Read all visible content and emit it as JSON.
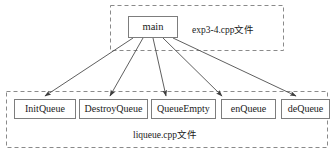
{
  "diagram": {
    "type": "call-hierarchy",
    "title": "",
    "groups": [
      {
        "id": "exp3-4",
        "label": "exp3-4.cpp文件",
        "border_style": "dashed",
        "border_color": "#8a8a8a"
      },
      {
        "id": "liqueue",
        "label": "liqueue.cpp文件",
        "border_style": "dashed",
        "border_color": "#8a8a8a"
      }
    ],
    "nodes": {
      "main": {
        "label": "main"
      },
      "functions": [
        {
          "label": "InitQueue"
        },
        {
          "label": "DestroyQueue"
        },
        {
          "label": "QueueEmpty"
        },
        {
          "label": "enQueue"
        },
        {
          "label": "deQueue"
        }
      ]
    },
    "edges": [
      {
        "from": "main",
        "to": "InitQueue",
        "arrow": "filled"
      },
      {
        "from": "main",
        "to": "DestroyQueue",
        "arrow": "filled"
      },
      {
        "from": "main",
        "to": "QueueEmpty",
        "arrow": "filled"
      },
      {
        "from": "main",
        "to": "enQueue",
        "arrow": "filled"
      },
      {
        "from": "main",
        "to": "deQueue",
        "arrow": "filled"
      }
    ],
    "colors": {
      "node_border": "#7d7d7d",
      "group_border": "#8a8a8a",
      "edge": "#4d4d4d",
      "text": "#1a1a1a",
      "background": "#ffffff"
    }
  }
}
